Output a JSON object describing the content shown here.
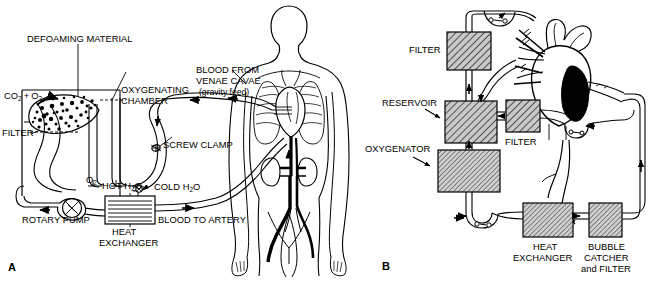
{
  "figure": {
    "panels": [
      {
        "letter": "A",
        "name": "bubble-oxygenator-circuit-with-patient",
        "labels": {
          "defoaming_material": "DEFOAMING MATERIAL",
          "gas_inlet": "CO2 + O2",
          "gas_inlet_parts": {
            "co2": "CO",
            "co2_sub": "2",
            "plus": "+",
            "o2": "O",
            "o2_sub": "2"
          },
          "filter": "FILTER",
          "oxygenating_chamber_line1": "OXYGENATING",
          "oxygenating_chamber_line2": "CHAMBER",
          "blood_from_line1": "BLOOD FROM",
          "blood_from_line2": "VENAE CAVAE",
          "blood_from_line3": "(gravity feed)",
          "screw_clamp": "SCREW CLAMP",
          "oxygen_vent": "O2",
          "oxygen_vent_parts": {
            "base": "O",
            "sub": "2"
          },
          "hot_water": "HOT H2O",
          "hot_water_parts": {
            "pre": "HOT H",
            "sub": "2",
            "post": "O"
          },
          "cold_water": "COLD H2O",
          "cold_water_parts": {
            "pre": "COLD H",
            "sub": "2",
            "post": "O"
          },
          "rotary_pump": "ROTARY PUMP",
          "heat_exchanger_line1": "HEAT",
          "heat_exchanger_line2": "EXCHANGER",
          "blood_to_artery": "BLOOD TO ARTERY"
        }
      },
      {
        "letter": "B",
        "name": "component-block-circuit-with-heart",
        "labels": {
          "filter_top": "FILTER",
          "reservoir": "RESERVOIR",
          "filter_mid": "FILTER",
          "oxygenator": "OXYGENATOR",
          "heat_exchanger_line1": "HEAT",
          "heat_exchanger_line2": "EXCHANGER",
          "bubble_catcher_line1": "BUBBLE",
          "bubble_catcher_line2": "CATCHER",
          "bubble_catcher_line3": "and FILTER"
        }
      }
    ],
    "colors": {
      "background": "#ffffff",
      "ink": "#000000",
      "hatch_fill": "#b5b5b5",
      "vessel_fill": "#000000"
    }
  }
}
